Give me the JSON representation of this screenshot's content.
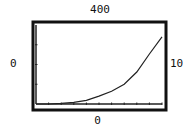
{
  "window": {
    "ymax": "400",
    "ymin": "0",
    "xmin": "0",
    "xmax": "10"
  },
  "colors": {
    "frame": "#111111",
    "curve": "#222222",
    "background": "#ffffff"
  },
  "chart_data": {
    "type": "line",
    "title": "",
    "xlabel": "",
    "ylabel": "",
    "xlim": [
      0,
      10
    ],
    "ylim": [
      0,
      400
    ],
    "grid": false,
    "x_tick_step": 1,
    "y_tick_step": 100,
    "series": [
      {
        "name": "f(x)",
        "x": [
          0,
          1,
          2,
          3,
          4,
          5,
          6,
          7,
          8,
          9,
          10
        ],
        "values": [
          0,
          0,
          3,
          8,
          18,
          40,
          65,
          100,
          162,
          253,
          340
        ]
      }
    ],
    "annotations": [
      "400",
      "0",
      "0",
      "10"
    ]
  }
}
